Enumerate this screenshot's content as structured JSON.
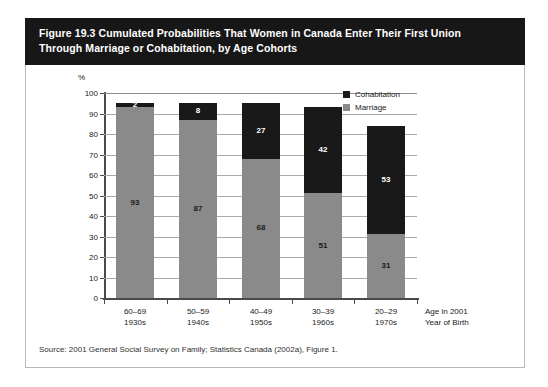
{
  "figure": {
    "title_line1": "Figure 19.3 Cumulated Probabilities That Women in Canada Enter Their First Union",
    "title_line2": "Through Marriage or Cohabitation, by Age Cohorts",
    "source": "Source: 2001 General Social Survey on Family; Statistics Canada (2002a), Figure 1."
  },
  "chart_data": {
    "type": "bar",
    "subtype": "stacked",
    "title": "Figure 19.3 Cumulated Probabilities That Women in Canada Enter Their First Union Through Marriage or Cohabitation, by Age Cohorts",
    "categories": [
      "60–69",
      "50–59",
      "40–49",
      "30–39",
      "20–29"
    ],
    "category_sublabels": [
      "1930s",
      "1940s",
      "1950s",
      "1960s",
      "1970s"
    ],
    "series": [
      {
        "name": "Marriage",
        "color": "#8a8a8a",
        "values": [
          93,
          87,
          68,
          51,
          31
        ]
      },
      {
        "name": "Cohabitation",
        "color": "#191919",
        "values": [
          2,
          8,
          27,
          42,
          53
        ]
      }
    ],
    "totals": [
      95,
      95,
      95,
      93,
      84
    ],
    "xlabel_line1": "Age in 2001",
    "xlabel_line2": "Year of Birth",
    "ylabel": "%",
    "ylim": [
      0,
      100
    ],
    "yticks": [
      0,
      10,
      20,
      30,
      40,
      50,
      60,
      70,
      80,
      90,
      100
    ],
    "ytick_labels": [
      "0",
      "10",
      "20",
      "30",
      "40",
      "50",
      "60",
      "70",
      "80",
      "90",
      "100"
    ],
    "grid": true,
    "legend_position": "top-right",
    "legend": [
      "Cohabitation",
      "Marriage"
    ]
  }
}
